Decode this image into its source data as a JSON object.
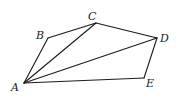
{
  "diagram": {
    "type": "polygon-with-diagonals",
    "vertices": [
      {
        "id": "A",
        "label": "A",
        "x": 24,
        "y": 83,
        "lx": 11,
        "ly": 91
      },
      {
        "id": "B",
        "label": "B",
        "x": 48,
        "y": 38,
        "lx": 36,
        "ly": 39
      },
      {
        "id": "C",
        "label": "C",
        "x": 96,
        "y": 23,
        "lx": 88,
        "ly": 20
      },
      {
        "id": "D",
        "label": "D",
        "x": 157,
        "y": 38,
        "lx": 160,
        "ly": 42
      },
      {
        "id": "E",
        "label": "E",
        "x": 144,
        "y": 78,
        "lx": 146,
        "ly": 87
      }
    ],
    "edges": [
      {
        "from": "A",
        "to": "B",
        "kind": "side"
      },
      {
        "from": "B",
        "to": "C",
        "kind": "side"
      },
      {
        "from": "C",
        "to": "D",
        "kind": "side"
      },
      {
        "from": "D",
        "to": "E",
        "kind": "side"
      },
      {
        "from": "E",
        "to": "A",
        "kind": "side"
      },
      {
        "from": "A",
        "to": "C",
        "kind": "diagonal"
      },
      {
        "from": "A",
        "to": "D",
        "kind": "diagonal"
      }
    ],
    "stroke_color": "#1a1a1a"
  }
}
